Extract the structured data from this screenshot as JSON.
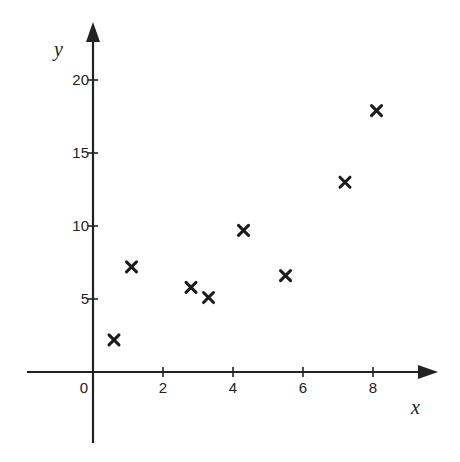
{
  "chart_data": {
    "type": "scatter",
    "title": "",
    "xlabel": "x",
    "ylabel": "y",
    "xlim": [
      -1.9,
      9.8
    ],
    "ylim": [
      -4.8,
      24
    ],
    "x_ticks": [
      0,
      2,
      4,
      6,
      8
    ],
    "y_ticks": [
      5,
      10,
      15,
      20
    ],
    "x_tick_labels": [
      "0",
      "2",
      "4",
      "6",
      "8"
    ],
    "y_tick_labels": [
      "5",
      "10",
      "15",
      "20"
    ],
    "grid": false,
    "legend": null,
    "marker": "x",
    "series": [
      {
        "name": "data",
        "points": [
          {
            "x": 0.6,
            "y": 2.2
          },
          {
            "x": 1.1,
            "y": 7.2
          },
          {
            "x": 2.8,
            "y": 5.8
          },
          {
            "x": 3.3,
            "y": 5.1
          },
          {
            "x": 4.3,
            "y": 9.7
          },
          {
            "x": 5.5,
            "y": 6.6
          },
          {
            "x": 7.2,
            "y": 13.0
          },
          {
            "x": 8.1,
            "y": 17.9
          }
        ]
      }
    ]
  },
  "colors": {
    "axis": "#222222",
    "marker": "#1a1a1a",
    "background": "#ffffff"
  }
}
